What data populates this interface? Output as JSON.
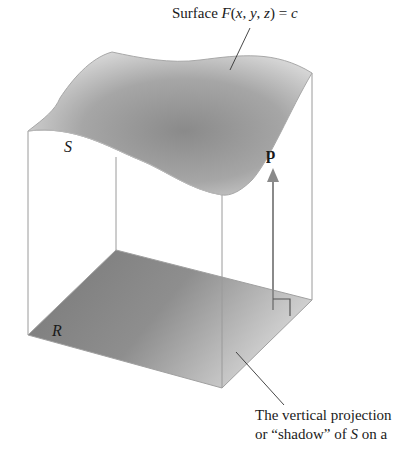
{
  "figure": {
    "surface_label": {
      "prefix": "Surface ",
      "function": "F",
      "open": "(",
      "x": "x",
      "sep1": ", ",
      "y": "y",
      "sep2": ",  ",
      "z": "z",
      "close": ") = ",
      "c": "c"
    },
    "surface_name": "S",
    "region_name": "R",
    "vector_name": "p",
    "caption": {
      "line1": "The vertical projection",
      "line2_prefix": "or “shadow” of ",
      "line2_S": "S",
      "line2_suffix": " on a"
    },
    "colors": {
      "surface_fill_center": "#8c8c8c",
      "surface_fill_edge": "#d4d4d4",
      "region_fill_dark": "#7a7a7a",
      "region_fill_light": "#cfcfcf",
      "edge_lines": "#9a9a9a",
      "arrow": "#8a8a8a",
      "text": "#1a1a1a"
    }
  }
}
